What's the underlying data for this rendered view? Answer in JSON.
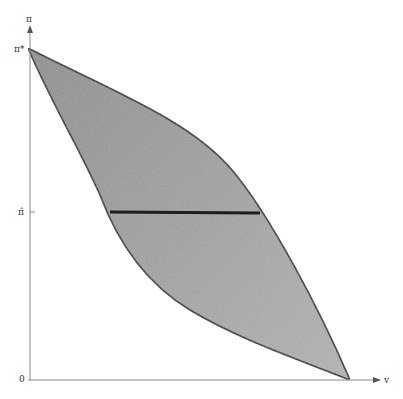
{
  "diagram": {
    "y_axis_label": "π",
    "x_axis_label": "v",
    "origin_label": "0",
    "y_tick_top_label": "π*",
    "y_tick_mid_label": "π̂",
    "colors": {
      "fill": "#a0a0a0",
      "stroke": "#2a2a2a",
      "axis": "#888888"
    },
    "regions": [
      {
        "name": "shaded lens region between two curves from (0, π*) to (v_max, 0)"
      }
    ],
    "lines": [
      {
        "name": "horizontal segment at π̂ spanning the shaded region"
      }
    ]
  }
}
